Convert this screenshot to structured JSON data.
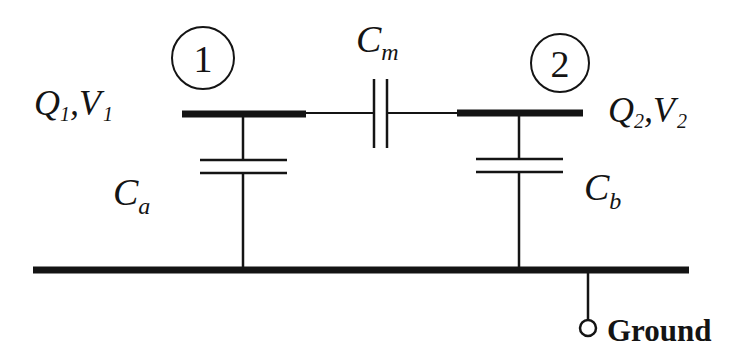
{
  "diagram": {
    "type": "two-conductor capacitance circuit",
    "colors": {
      "ink": "#141414",
      "background": "#ffffff"
    },
    "nodes": [
      {
        "id": "1",
        "label": "1",
        "charge": "Q",
        "charge_sub": "1",
        "voltage": "V",
        "voltage_sub": "1",
        "sep": ","
      },
      {
        "id": "2",
        "label": "2",
        "charge": "Q",
        "charge_sub": "2",
        "voltage": "V",
        "voltage_sub": "2",
        "sep": ","
      }
    ],
    "capacitors": {
      "mutual": {
        "symbol": "C",
        "sub": "m",
        "between": [
          "1",
          "2"
        ]
      },
      "a": {
        "symbol": "C",
        "sub": "a",
        "between": [
          "1",
          "ground"
        ]
      },
      "b": {
        "symbol": "C",
        "sub": "b",
        "between": [
          "2",
          "ground"
        ]
      }
    },
    "ground": {
      "label": "Ground"
    }
  }
}
